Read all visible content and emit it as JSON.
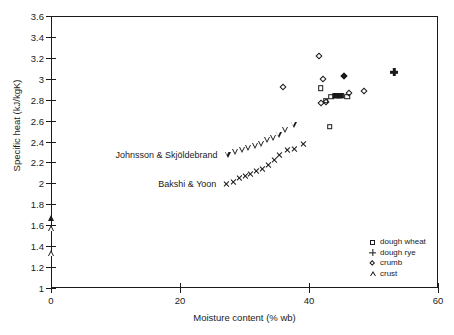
{
  "chart_data": {
    "type": "scatter",
    "title": "",
    "xlabel": "Moisture content (% wb)",
    "ylabel": "Specific heat (kJ/kgK)",
    "xlim": [
      0,
      60
    ],
    "ylim": [
      1,
      3.6
    ],
    "xticks": [
      0,
      20,
      40,
      60
    ],
    "xtick_labels": [
      "0",
      "20",
      "40",
      "60"
    ],
    "yticks": [
      1,
      1.2,
      1.4,
      1.6,
      1.8,
      2,
      2.2,
      2.4,
      2.6,
      2.8,
      3,
      3.2,
      3.4,
      3.6
    ],
    "ytick_labels": [
      "1",
      "1.2",
      "1.4",
      "1.6",
      "1.8",
      "2",
      "2.2",
      "2.4",
      "2.6",
      "2.8",
      "3",
      "3.2",
      "3.4",
      "3.6"
    ],
    "grid": false,
    "legend_position": "lower-right",
    "series": [
      {
        "name": "dough wheat",
        "marker": "square-open",
        "points": [
          [
            41.8,
            2.91
          ],
          [
            42.6,
            2.79
          ],
          [
            43.4,
            2.83
          ],
          [
            44.0,
            2.84
          ],
          [
            44.6,
            2.84
          ],
          [
            45.1,
            2.84
          ],
          [
            45.9,
            2.83
          ],
          [
            43.2,
            2.54
          ]
        ]
      },
      {
        "name": "dough wheat (filled)",
        "marker": "square-filled",
        "points": [
          [
            44.2,
            2.84
          ],
          [
            44.8,
            2.84
          ]
        ]
      },
      {
        "name": "dough rye",
        "marker": "plus-filled",
        "points": [
          [
            53.2,
            3.06
          ]
        ]
      },
      {
        "name": "crumb",
        "marker": "diamond-open",
        "points": [
          [
            36.0,
            2.92
          ],
          [
            41.6,
            3.215
          ],
          [
            42.2,
            3.0
          ],
          [
            41.9,
            2.765
          ],
          [
            42.6,
            2.78
          ],
          [
            48.5,
            2.88
          ],
          [
            46.2,
            2.86
          ]
        ]
      },
      {
        "name": "crumb (filled)",
        "marker": "diamond-filled",
        "points": [
          [
            45.5,
            3.03
          ]
        ]
      },
      {
        "name": "crust",
        "marker": "triangle-open",
        "points": [
          [
            0,
            1.57
          ],
          [
            0,
            1.33
          ]
        ]
      },
      {
        "name": "crust (filled)",
        "marker": "triangle-filled",
        "points": [
          [
            0,
            1.67
          ]
        ]
      },
      {
        "name": "Johnsson & Skjoldebrand",
        "marker": "triangle-down-open",
        "points": [
          [
            27.4,
            2.275
          ],
          [
            28.5,
            2.3
          ],
          [
            29.6,
            2.315
          ],
          [
            30.6,
            2.335
          ],
          [
            31.6,
            2.355
          ],
          [
            32.6,
            2.375
          ],
          [
            33.5,
            2.41
          ],
          [
            34.4,
            2.435
          ],
          [
            35.3,
            2.465
          ],
          [
            36.3,
            2.51
          ],
          [
            37.6,
            2.555
          ]
        ]
      },
      {
        "name": "Bakshi & Yoon",
        "marker": "x",
        "points": [
          [
            27.2,
            1.995
          ],
          [
            28.3,
            2.015
          ],
          [
            29.3,
            2.05
          ],
          [
            30.2,
            2.075
          ],
          [
            31.0,
            2.09
          ],
          [
            31.9,
            2.115
          ],
          [
            32.8,
            2.14
          ],
          [
            33.7,
            2.175
          ],
          [
            34.6,
            2.22
          ],
          [
            35.5,
            2.27
          ],
          [
            36.6,
            2.315
          ],
          [
            37.8,
            2.33
          ],
          [
            39.2,
            2.375
          ]
        ]
      }
    ],
    "annotations": [
      {
        "text": "Johnsson & Skjöldebrand",
        "x": 26.3,
        "y": 2.275
      },
      {
        "text": "Bakshi & Yoon",
        "x": 26.1,
        "y": 1.995
      }
    ],
    "legend": [
      {
        "label": "dough wheat",
        "marker": "square-open"
      },
      {
        "label": "dough rye",
        "marker": "plus"
      },
      {
        "label": "crumb",
        "marker": "diamond-open"
      },
      {
        "label": "crust",
        "marker": "triangle-open"
      }
    ],
    "colors": {
      "ink": "#1a1a1a",
      "background": "#ffffff"
    }
  }
}
